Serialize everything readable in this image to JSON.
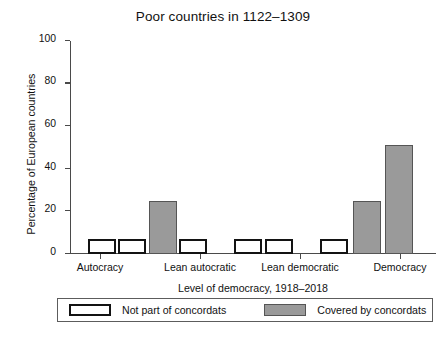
{
  "chart_data": {
    "type": "bar",
    "title": "Poor countries in 1122–1309",
    "xlabel": "Level of democracy, 1918–2018",
    "ylabel": "Percentage of European countries",
    "ylim": [
      0,
      100
    ],
    "yticks": [
      0,
      20,
      40,
      60,
      80,
      100
    ],
    "ytick_labels": [
      "0",
      "20",
      "40",
      "60",
      "80",
      "100"
    ],
    "grid": false,
    "legend_position": "bottom",
    "categories": [
      "Autocracy",
      "Lean autocratic",
      "Lean democratic",
      "Democracy"
    ],
    "series": [
      {
        "name": "Not part of concordats",
        "color": "#ffffff",
        "edge_color": "#131313",
        "values": [
          0,
          7,
          7,
          7
        ]
      },
      {
        "name": "Covered by concordats",
        "color": "#9a9a9a",
        "edge_color": "#555555",
        "values": [
          0,
          25,
          0,
          51
        ]
      }
    ],
    "bars": [
      {
        "group": "Lean autocratic",
        "series": "Not part of concordats",
        "value": 7,
        "x_center": 31.5
      },
      {
        "group": "Lean autocratic",
        "series": "Not part of concordats",
        "value": 7,
        "x_center": 62.0
      },
      {
        "group": "Lean autocratic",
        "series": "Covered by concordats",
        "value": 25,
        "x_center": 92.5
      },
      {
        "group": "Lean autocratic",
        "series": "Not part of concordats",
        "value": 7,
        "x_center": 123.0
      },
      {
        "group": "Lean democratic",
        "series": "Not part of concordats",
        "value": 7,
        "x_center": 178.0
      },
      {
        "group": "Lean democratic",
        "series": "Not part of concordats",
        "value": 7,
        "x_center": 208.5
      },
      {
        "group": "Democracy",
        "series": "Not part of concordats",
        "value": 7,
        "x_center": 264.0
      },
      {
        "group": "Democracy",
        "series": "Covered by concordats",
        "value": 25,
        "x_center": 296.5
      },
      {
        "group": "Democracy",
        "series": "Covered by concordats",
        "value": 51,
        "x_center": 329.0
      }
    ],
    "category_tick_positions": [
      30,
      130,
      230,
      330
    ],
    "category_label_positions": [
      30,
      130,
      230,
      330
    ]
  },
  "legend": {
    "items": [
      {
        "label": "Not part of concordats",
        "style": "light"
      },
      {
        "label": "Covered by concordats",
        "style": "dark"
      }
    ]
  },
  "bottom_caption": "                                                                                                                        "
}
